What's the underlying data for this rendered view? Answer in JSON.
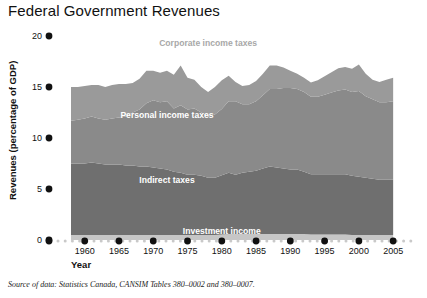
{
  "title": "Federal Government Revenues",
  "source_note": "Source of data: Statistics Canada, CANSIM Tables 380–0002 and 380–0007.",
  "axes": {
    "y_axis_title": "Revenues (percentage of GDP)",
    "x_axis_title": "Year",
    "y_ticks": [
      "0",
      "5",
      "10",
      "15",
      "20"
    ],
    "x_ticks": [
      "1960",
      "1965",
      "1970",
      "1975",
      "1980",
      "1985",
      "1990",
      "1995",
      "2000",
      "2005"
    ]
  },
  "series_labels": {
    "corporate": "Corporate income taxes",
    "personal": "Personal income taxes",
    "indirect": "Indirect taxes",
    "investment": "Investment income"
  },
  "colors": {
    "corporate": "#9a9a9a",
    "personal": "#8a8a8a",
    "indirect": "#6f6f6f",
    "investment": "#c6c6c6",
    "axis_dot": "#111111",
    "minor_dot": "#c9c9c9",
    "title_text": "#111111",
    "inside_label": "#ffffff",
    "outside_label": "#a8a8a8"
  },
  "chart_data": {
    "type": "area",
    "stacked": true,
    "title": "Federal Government Revenues",
    "xlabel": "Year",
    "ylabel": "Revenues (percentage of GDP)",
    "xlim": [
      1958,
      2006
    ],
    "ylim": [
      0,
      20
    ],
    "grid": false,
    "legend": "inline-annotations",
    "x": [
      1958,
      1959,
      1960,
      1961,
      1962,
      1963,
      1964,
      1965,
      1966,
      1967,
      1968,
      1969,
      1970,
      1971,
      1972,
      1973,
      1974,
      1975,
      1976,
      1977,
      1978,
      1979,
      1980,
      1981,
      1982,
      1983,
      1984,
      1985,
      1986,
      1987,
      1988,
      1989,
      1990,
      1991,
      1992,
      1993,
      1994,
      1995,
      1996,
      1997,
      1998,
      1999,
      2000,
      2001,
      2002,
      2003,
      2004,
      2005
    ],
    "series": [
      {
        "name": "Investment income",
        "values": [
          0.5,
          0.5,
          0.5,
          0.5,
          0.5,
          0.5,
          0.5,
          0.5,
          0.5,
          0.5,
          0.5,
          0.5,
          0.5,
          0.5,
          0.5,
          0.5,
          0.5,
          0.5,
          0.5,
          0.5,
          0.5,
          0.5,
          0.55,
          0.6,
          0.6,
          0.6,
          0.6,
          0.6,
          0.6,
          0.6,
          0.6,
          0.6,
          0.6,
          0.6,
          0.6,
          0.55,
          0.55,
          0.55,
          0.55,
          0.55,
          0.55,
          0.5,
          0.5,
          0.5,
          0.5,
          0.5,
          0.5,
          0.5
        ]
      },
      {
        "name": "Indirect taxes",
        "values": [
          7.0,
          7.0,
          7.0,
          7.1,
          7.0,
          6.9,
          6.9,
          6.9,
          6.8,
          6.8,
          6.7,
          6.7,
          6.6,
          6.5,
          6.4,
          6.2,
          6.1,
          5.9,
          5.9,
          5.8,
          5.6,
          5.6,
          5.8,
          6.0,
          5.8,
          6.0,
          6.1,
          6.2,
          6.4,
          6.6,
          6.5,
          6.4,
          6.3,
          6.3,
          6.1,
          5.9,
          5.9,
          5.9,
          5.9,
          5.9,
          5.9,
          5.8,
          5.7,
          5.6,
          5.5,
          5.4,
          5.4,
          5.4
        ]
      },
      {
        "name": "Personal income taxes",
        "values": [
          4.2,
          4.3,
          4.4,
          4.5,
          4.4,
          4.4,
          4.5,
          4.6,
          4.8,
          5.2,
          5.6,
          6.2,
          6.6,
          6.5,
          6.7,
          6.2,
          6.6,
          6.4,
          6.5,
          6.2,
          6.0,
          6.2,
          6.5,
          7.0,
          7.2,
          6.7,
          6.6,
          6.8,
          7.2,
          7.6,
          7.7,
          7.9,
          8.0,
          7.9,
          7.8,
          7.6,
          7.6,
          7.8,
          8.0,
          8.2,
          8.3,
          8.2,
          8.4,
          8.0,
          7.8,
          7.6,
          7.6,
          7.7
        ]
      },
      {
        "name": "Corporate income taxes",
        "values": [
          3.3,
          3.2,
          3.2,
          3.1,
          3.3,
          3.2,
          3.3,
          3.3,
          3.2,
          2.9,
          3.0,
          3.2,
          2.9,
          2.9,
          3.0,
          3.3,
          3.9,
          3.1,
          2.8,
          2.5,
          2.4,
          2.7,
          2.8,
          2.5,
          1.9,
          1.8,
          1.9,
          2.0,
          2.1,
          2.3,
          2.3,
          2.0,
          1.7,
          1.5,
          1.4,
          1.4,
          1.6,
          1.8,
          2.0,
          2.2,
          2.2,
          2.3,
          2.6,
          2.2,
          1.9,
          2.0,
          2.2,
          2.3
        ]
      }
    ],
    "annotations": [
      {
        "text": "Corporate income taxes",
        "x": 1978,
        "y": 19.0,
        "color": "#a8a8a8"
      },
      {
        "text": "Personal income taxes",
        "x": 1972,
        "y": 12.0,
        "color": "#ffffff"
      },
      {
        "text": "Indirect taxes",
        "x": 1972,
        "y": 5.6,
        "color": "#ffffff"
      },
      {
        "text": "Investment income",
        "x": 1980,
        "y": 0.6,
        "color": "#ffffff"
      }
    ]
  }
}
